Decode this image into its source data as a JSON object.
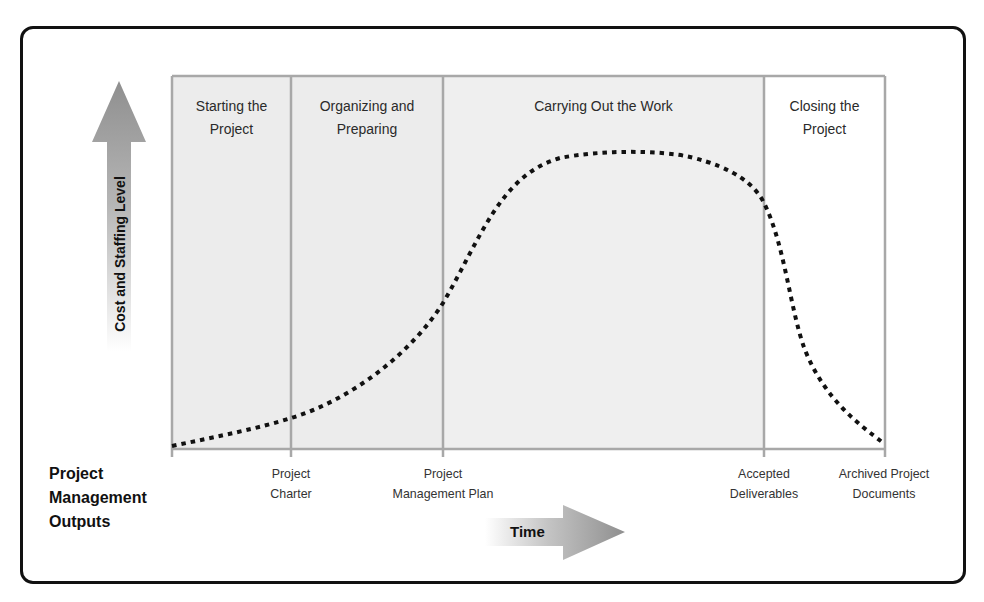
{
  "diagram": {
    "type": "project-life-cycle",
    "y_axis_label": "Cost and Staffing Level",
    "x_axis_label": "Time",
    "outputs_heading": [
      "Project",
      "Management",
      "Outputs"
    ],
    "phases": [
      {
        "title_line1": "Starting the",
        "title_line2": "Project",
        "shaded": true
      },
      {
        "title_line1": "Organizing and",
        "title_line2": "Preparing",
        "shaded": true
      },
      {
        "title_line1": "Carrying Out the Work",
        "title_line2": "",
        "shaded": true
      },
      {
        "title_line1": "Closing the",
        "title_line2": "Project",
        "shaded": false
      }
    ],
    "outputs": [
      {
        "line1": "Project",
        "line2": "Charter"
      },
      {
        "line1": "Project",
        "line2": "Management Plan"
      },
      {
        "line1": "Accepted",
        "line2": "Deliverables"
      },
      {
        "line1": "Archived Project",
        "line2": "Documents"
      }
    ],
    "curve": {
      "style": "dotted",
      "description": "Cost and staffing level rises slowly at start, climbs steeply during organizing, plateaus while carrying out work, then drops sharply when closing"
    },
    "colors": {
      "phase_fill": "#ececec",
      "grid_line": "#a8a8a8",
      "curve": "#111111",
      "arrow_gray": "#9a9a9a",
      "frame": "#111111"
    }
  }
}
